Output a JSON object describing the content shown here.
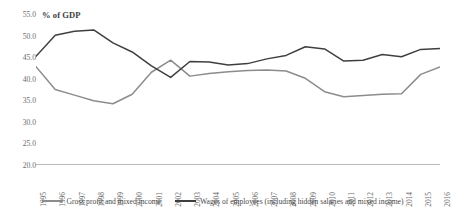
{
  "chart_data": {
    "type": "line",
    "title": "",
    "ylabel": "% of GDP",
    "xlabel": "",
    "ylim": [
      20.0,
      55.0
    ],
    "ytick_step": 5.0,
    "grid": false,
    "legend_position": "bottom",
    "categories": [
      "1995",
      "1996",
      "1997",
      "1998",
      "1999",
      "2000",
      "2001",
      "2002",
      "2003",
      "2004",
      "2005",
      "2006",
      "2007",
      "2008",
      "2009",
      "2010",
      "2011",
      "2012",
      "2013",
      "2014",
      "2015",
      "2016"
    ],
    "yticks": [
      "55.0",
      "50.0",
      "45.0",
      "40.0",
      "35.0",
      "30.0",
      "25.0",
      "20.0"
    ],
    "series": [
      {
        "name": "Gross profit and mixed income",
        "color": "#8c8c8c",
        "values": [
          42.8,
          37.5,
          36.2,
          34.9,
          34.2,
          36.4,
          41.5,
          44.3,
          40.6,
          41.2,
          41.6,
          41.9,
          42.0,
          41.8,
          40.1,
          37.0,
          35.8,
          36.1,
          36.4,
          36.5,
          41.0,
          42.7
        ]
      },
      {
        "name": "Wages of employees (including hidden salaries and mixed income)",
        "color": "#3f3f3f",
        "values": [
          45.2,
          50.1,
          51.0,
          51.3,
          48.3,
          46.2,
          43.0,
          40.3,
          44.0,
          43.9,
          43.2,
          43.5,
          44.6,
          45.4,
          47.4,
          46.9,
          44.1,
          44.3,
          45.6,
          45.1,
          46.8,
          47.0
        ]
      }
    ]
  },
  "legend": {
    "items": [
      {
        "label": "Gross profit and mixed income",
        "color": "#8c8c8c"
      },
      {
        "label": "Wages of employees (including hidden salaries and mixed income)",
        "color": "#3f3f3f"
      }
    ]
  }
}
